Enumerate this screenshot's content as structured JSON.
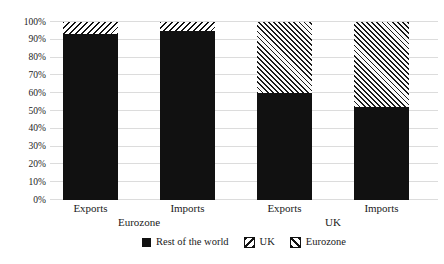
{
  "chart_data": {
    "type": "bar",
    "subtype": "stacked-100-percent",
    "title": "",
    "categories": [
      "Exports",
      "Imports",
      "Exports",
      "Imports"
    ],
    "group_labels": [
      {
        "label": "Eurozone",
        "spans": [
          0,
          1
        ]
      },
      {
        "label": "UK",
        "spans": [
          2,
          3
        ]
      }
    ],
    "series": [
      {
        "name": "Rest of the world",
        "pattern": "solid",
        "values": [
          93,
          95,
          60,
          52
        ]
      },
      {
        "name": "UK",
        "pattern": "hatch-up",
        "values": [
          7,
          5,
          0,
          0
        ]
      },
      {
        "name": "Eurozone",
        "pattern": "hatch-down",
        "values": [
          0,
          0,
          40,
          48
        ]
      }
    ],
    "y_axis": {
      "min": 0,
      "max": 100,
      "tick_step": 10,
      "tick_labels": [
        "0%",
        "10%",
        "20%",
        "30%",
        "40%",
        "50%",
        "60%",
        "70%",
        "80%",
        "90%",
        "100%"
      ],
      "grid": true
    },
    "legend": {
      "position": "bottom",
      "entries": [
        "Rest of the world",
        "UK",
        "Eurozone"
      ]
    }
  },
  "colors": {
    "series_black": "#111111",
    "gridline": "#dcdcdc",
    "text": "#1a1a1a",
    "background": "#ffffff"
  }
}
